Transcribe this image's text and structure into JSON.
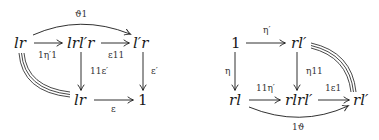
{
  "diagrams": [
    {
      "name": "left-square",
      "objects": {
        "lr_top": "lr",
        "lrl_r": "lrl′r",
        "l_r": "l′r",
        "lr_bottom": "lr",
        "one": "1"
      },
      "arrows": {
        "top_curve": "ϑ1",
        "lr_to_lrlr": "1η′1",
        "lrlr_to_lr": "ε11",
        "lrlr_down": "11ε′",
        "lr_down": "ε′",
        "bottom": "ε"
      },
      "equalities": [
        "lr = lr (triple line, curved left)"
      ]
    },
    {
      "name": "right-square",
      "objects": {
        "one": "1",
        "rl_top": "rl′",
        "rl_left": "rl",
        "rlrl": "rlrl′",
        "rl_right": "rl′"
      },
      "arrows": {
        "top": "η′",
        "left_down": "η",
        "mid_down": "η11",
        "bottom_left": "11η′",
        "bottom_right": "1ε1",
        "bottom_curve": "1ϑ"
      },
      "equalities": [
        "rl′ = rl′ (triple line, curved right)"
      ]
    }
  ]
}
